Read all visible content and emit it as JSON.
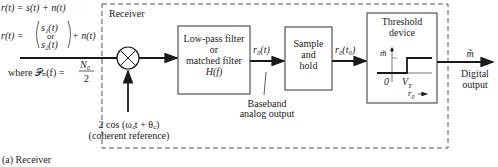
{
  "input": {
    "eq1": "r(t) = s(t) + n(t)",
    "eq2_lhs": "r(t) =",
    "eq2_top": "s₁(t)",
    "eq2_mid": "or",
    "eq2_bot": "s₂(t)",
    "eq2_rhs": "+ n(t)",
    "psd": "where 𝒫ₙ(f) =",
    "psd_num": "N₀",
    "psd_den": "2"
  },
  "receiver": {
    "label": "Receiver",
    "reference_line1": "2 cos (ω꜀t + θ꜀)",
    "reference_line2": "(coherent reference)"
  },
  "blocks": {
    "filter": [
      "Low-pass filter",
      "or",
      "matched filter",
      "H(f)"
    ],
    "sample": [
      "Sample",
      "and",
      "hold"
    ],
    "threshold": [
      "Threshold",
      "device"
    ]
  },
  "signals": {
    "filter_out": "r₀(t)",
    "sample_out": "r₀(t₀)",
    "baseband1": "Baseband",
    "baseband2": "analog output",
    "output_symbol": "m̃",
    "output1": "Digital",
    "output2": "output"
  },
  "threshold_graph": {
    "y_label": "m̃",
    "origin": "0",
    "vt": "V_T",
    "x_label": "r₀ →"
  },
  "caption": "(a) Receiver"
}
